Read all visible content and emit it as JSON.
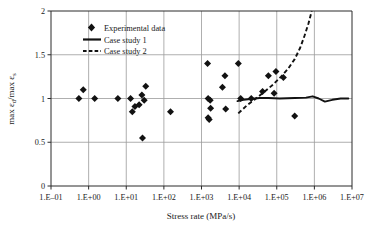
{
  "chart_data": {
    "type": "scatter",
    "title": "",
    "xlabel": "Stress rate (MPa/s)",
    "ylabel": "max εd/max εs",
    "ylabel_parts": {
      "prefix": "max ",
      "sym1": "ε",
      "sub1": "d",
      "slash": "/max ",
      "sym2": "ε",
      "sub2": "s"
    },
    "x_scale": "log",
    "xlim": [
      0.1,
      10000000
    ],
    "ylim": [
      0,
      2
    ],
    "grid": true,
    "legend_position": "top-left-inside",
    "x_tick_labels": [
      "1.E–01",
      "1.E+00",
      "1.E+01",
      "1.E+02",
      "1.E+03",
      "1.E+04",
      "1.E+05",
      "1.E+06",
      "1.E+07"
    ],
    "x_tick_values": [
      0.1,
      1,
      10,
      100,
      1000,
      10000,
      100000,
      1000000,
      10000000
    ],
    "y_tick_labels": [
      "0",
      "0.5",
      "1",
      "1.5",
      "2"
    ],
    "y_tick_values": [
      0,
      0.5,
      1,
      1.5,
      2
    ],
    "series": [
      {
        "name": "Experimental data",
        "type": "scatter",
        "marker": "diamond",
        "color": "#121212",
        "points": [
          [
            0.55,
            1.0
          ],
          [
            0.72,
            1.1
          ],
          [
            1.45,
            1.0
          ],
          [
            6.0,
            1.0
          ],
          [
            13.0,
            1.0
          ],
          [
            14.5,
            0.85
          ],
          [
            17.0,
            0.91
          ],
          [
            22.0,
            0.93
          ],
          [
            26.0,
            1.04
          ],
          [
            30.0,
            0.98
          ],
          [
            33.0,
            1.14
          ],
          [
            27.0,
            0.55
          ],
          [
            150.0,
            0.85
          ],
          [
            1450.0,
            1.4
          ],
          [
            1500.0,
            1.0
          ],
          [
            1700.0,
            0.98
          ],
          [
            1750.0,
            0.89
          ],
          [
            1500.0,
            0.78
          ],
          [
            1600.0,
            0.76
          ],
          [
            3600.0,
            1.13
          ],
          [
            4200.0,
            1.26
          ],
          [
            4400.0,
            0.88
          ],
          [
            9500.0,
            1.4
          ],
          [
            11000.0,
            1.0
          ],
          [
            21000.0,
            1.0
          ],
          [
            42000.0,
            1.08
          ],
          [
            60000.0,
            1.26
          ],
          [
            85000.0,
            1.06
          ],
          [
            95000.0,
            1.31
          ],
          [
            150000.0,
            1.24
          ],
          [
            300000.0,
            0.8
          ]
        ]
      },
      {
        "name": "Case study 1",
        "type": "line",
        "style": "solid",
        "color": "#121212",
        "points": [
          [
            9000,
            0.97
          ],
          [
            13000,
            0.985
          ],
          [
            20000,
            0.995
          ],
          [
            35000,
            1.005
          ],
          [
            60000,
            1.005
          ],
          [
            120000,
            1.0
          ],
          [
            300000,
            1.005
          ],
          [
            600000,
            1.01
          ],
          [
            900000,
            1.025
          ],
          [
            1300000,
            1.0
          ],
          [
            1900000,
            0.965
          ],
          [
            3000000,
            0.985
          ],
          [
            5000000,
            1.0
          ],
          [
            8000000,
            1.0
          ]
        ]
      },
      {
        "name": "Case study 2",
        "type": "line",
        "style": "dashed",
        "color": "#121212",
        "points": [
          [
            9500,
            0.83
          ],
          [
            16000,
            0.92
          ],
          [
            26000,
            0.99
          ],
          [
            45000,
            1.07
          ],
          [
            80000,
            1.16
          ],
          [
            130000,
            1.25
          ],
          [
            200000,
            1.34
          ],
          [
            300000,
            1.45
          ],
          [
            420000,
            1.58
          ],
          [
            550000,
            1.72
          ],
          [
            700000,
            1.86
          ],
          [
            850000,
            2.0
          ]
        ]
      }
    ]
  },
  "legend": {
    "items": [
      {
        "label": "Experimental data",
        "marker": "diamond"
      },
      {
        "label": "Case study 1",
        "marker": "solid-line"
      },
      {
        "label": "Case study 2",
        "marker": "dashed-line"
      }
    ]
  }
}
